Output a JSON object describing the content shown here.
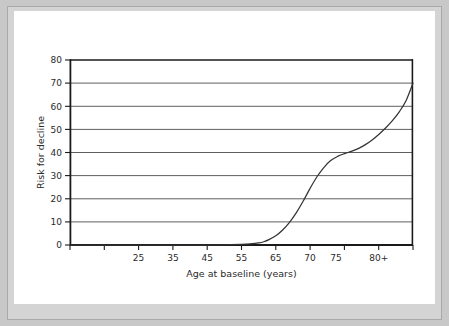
{
  "figure": {
    "background_color": "#ffffff",
    "mat_color": "#d4d4d4",
    "border_color": "#a9a9a9"
  },
  "chart_data": {
    "type": "line",
    "title": "",
    "subtitle": "",
    "xlabel": "Age at baseline (years)",
    "ylabel": "Risk for decline",
    "xlim": [
      0,
      10
    ],
    "ylim": [
      0,
      80
    ],
    "grid": true,
    "grid_axis": "y",
    "grid_color": "#555555",
    "legend": false,
    "legend_position": "none",
    "line_color": "#333333",
    "axis_color": "#1a1a1a",
    "x_tick_positions": [
      0,
      1,
      2,
      3,
      4,
      5,
      6,
      7,
      8,
      9,
      10
    ],
    "x_tick_labels": [
      "",
      "",
      "25",
      "35",
      "45",
      "55",
      "65",
      "70",
      "75",
      "80+",
      ""
    ],
    "x_tick_labels_visible": [
      "25",
      "35",
      "45",
      "55",
      "65",
      "70",
      "75",
      "80+"
    ],
    "y_ticks": [
      0,
      10,
      20,
      30,
      40,
      50,
      60,
      70,
      80
    ],
    "y_tick_labels": [
      "0",
      "10",
      "20",
      "30",
      "40",
      "50",
      "60",
      "70",
      "80"
    ],
    "categories": [
      "25",
      "35",
      "45",
      "55",
      "65",
      "70",
      "75",
      "80+"
    ],
    "series": [
      {
        "name": "Risk for decline",
        "x": [
          0.0,
          0.5,
          1.0,
          1.5,
          2.0,
          2.5,
          3.0,
          3.5,
          4.0,
          4.5,
          5.0,
          5.25,
          5.5,
          5.65,
          5.8,
          6.0,
          6.2,
          6.4,
          6.6,
          6.8,
          7.0,
          7.2,
          7.4,
          7.6,
          7.8,
          8.0,
          8.2,
          8.4,
          8.6,
          8.8,
          9.0,
          9.2,
          9.4,
          9.6,
          9.8,
          10.0
        ],
        "values": [
          0.0,
          0.0,
          0.0,
          0.0,
          0.0,
          0.0,
          0.0,
          0.0,
          0.0,
          0.1,
          0.3,
          0.5,
          0.9,
          1.4,
          2.3,
          4.0,
          6.5,
          9.8,
          14.0,
          19.0,
          24.5,
          29.5,
          33.5,
          36.5,
          38.3,
          39.5,
          40.5,
          41.7,
          43.3,
          45.3,
          47.8,
          50.6,
          53.8,
          57.6,
          62.5,
          70.0
        ]
      }
    ],
    "annotations": []
  }
}
